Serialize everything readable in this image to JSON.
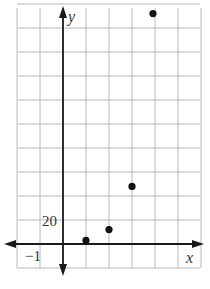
{
  "chart_data": {
    "type": "scatter",
    "title": "",
    "xlabel": "x",
    "ylabel": "y",
    "x_tick_label": "-1",
    "y_tick_label": "20",
    "x_unit_per_grid": 1,
    "y_unit_per_grid": 20,
    "xlim": [
      -2,
      6
    ],
    "ylim": [
      -20,
      200
    ],
    "grid": true,
    "legend": null,
    "points": [
      {
        "x": 1,
        "y": 3
      },
      {
        "x": 2,
        "y": 12
      },
      {
        "x": 3,
        "y": 48
      },
      {
        "x": 4,
        "y": 192
      }
    ]
  },
  "labels": {
    "x_axis": "x",
    "y_axis": "y",
    "x_tick": "−1",
    "y_tick": "20"
  },
  "colors": {
    "grid": "#b8b8b8",
    "axis": "#1a1a1a",
    "point": "#111111",
    "background": "#ffffff"
  }
}
